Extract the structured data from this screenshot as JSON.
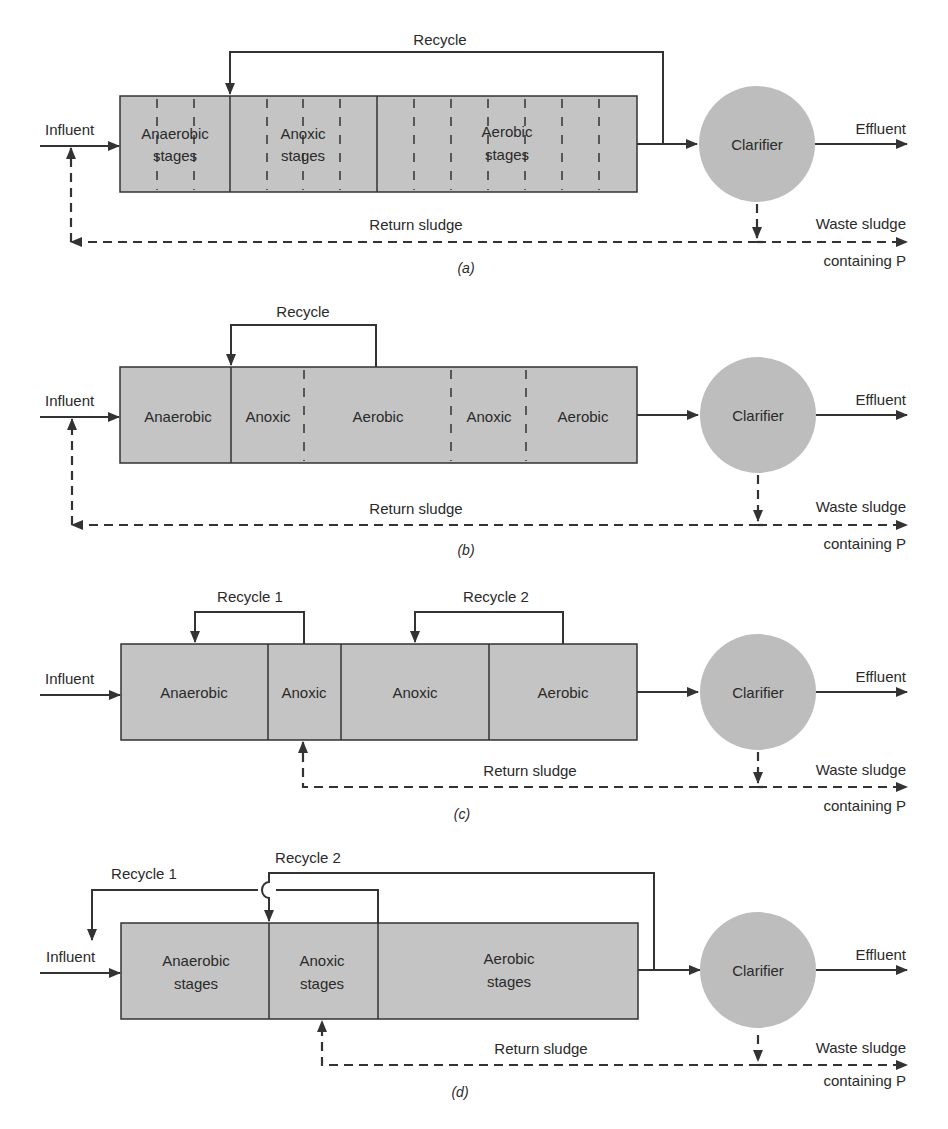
{
  "figure": {
    "panels": [
      {
        "id": "a",
        "caption": "(a)",
        "recycle_labels": [
          "Recycle"
        ],
        "zones": [
          {
            "line1": "Anaerobic",
            "line2": "stages"
          },
          {
            "line1": "Anoxic",
            "line2": "stages"
          },
          {
            "line1": "Aerobic",
            "line2": "stages"
          }
        ],
        "influent": "Influent",
        "effluent": "Effluent",
        "clarifier": "Clarifier",
        "return_sludge": "Return sludge",
        "waste_sludge_1": "Waste sludge",
        "waste_sludge_2": "containing P"
      },
      {
        "id": "b",
        "caption": "(b)",
        "recycle_labels": [
          "Recycle"
        ],
        "zones": [
          {
            "line1": "Anaerobic"
          },
          {
            "line1": "Anoxic"
          },
          {
            "line1": "Aerobic"
          },
          {
            "line1": "Anoxic"
          },
          {
            "line1": "Aerobic"
          }
        ],
        "influent": "Influent",
        "effluent": "Effluent",
        "clarifier": "Clarifier",
        "return_sludge": "Return sludge",
        "waste_sludge_1": "Waste sludge",
        "waste_sludge_2": "containing P"
      },
      {
        "id": "c",
        "caption": "(c)",
        "recycle_labels": [
          "Recycle 1",
          "Recycle 2"
        ],
        "zones": [
          {
            "line1": "Anaerobic"
          },
          {
            "line1": "Anoxic"
          },
          {
            "line1": "Anoxic"
          },
          {
            "line1": "Aerobic"
          }
        ],
        "influent": "Influent",
        "effluent": "Effluent",
        "clarifier": "Clarifier",
        "return_sludge": "Return sludge",
        "waste_sludge_1": "Waste sludge",
        "waste_sludge_2": "containing P"
      },
      {
        "id": "d",
        "caption": "(d)",
        "recycle_labels": [
          "Recycle 1",
          "Recycle 2"
        ],
        "zones": [
          {
            "line1": "Anaerobic",
            "line2": "stages"
          },
          {
            "line1": "Anoxic",
            "line2": "stages"
          },
          {
            "line1": "Aerobic",
            "line2": "stages"
          }
        ],
        "influent": "Influent",
        "effluent": "Effluent",
        "clarifier": "Clarifier",
        "return_sludge": "Return sludge",
        "waste_sludge_1": "Waste sludge",
        "waste_sludge_2": "containing P"
      }
    ]
  }
}
